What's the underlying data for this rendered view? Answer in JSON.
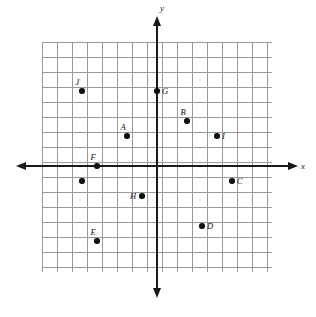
{
  "figure": {
    "type": "coordinate-plane",
    "title": "",
    "axis_labels": {
      "x": "x",
      "y": "y"
    },
    "grid": {
      "cell_px": 15,
      "origin_px": {
        "x": 157,
        "y": 166
      },
      "left_px": 42,
      "right_px": 272,
      "top_px": 42,
      "bottom_px": 272,
      "x_range": [
        -7,
        7
      ],
      "y_range": [
        -7,
        8
      ],
      "grid_color": "#9a9a9a",
      "axis_color": "#1a1a1a",
      "point_color": "#111111"
    }
  },
  "chart_data": {
    "type": "scatter",
    "title": "",
    "xlabel": "x",
    "ylabel": "y",
    "xlim": [
      -7,
      7
    ],
    "ylim": [
      -7,
      8
    ],
    "grid": true,
    "legend": "none",
    "points": [
      {
        "label": "J",
        "x": -5,
        "y": 5,
        "label_pos": "above-left"
      },
      {
        "label": "G",
        "x": 0,
        "y": 5,
        "label_pos": "right"
      },
      {
        "label": "B",
        "x": 2,
        "y": 3,
        "label_pos": "above-left"
      },
      {
        "label": "A",
        "x": -2,
        "y": 2,
        "label_pos": "above-left"
      },
      {
        "label": "I",
        "x": 4,
        "y": 2,
        "label_pos": "right"
      },
      {
        "label": "F",
        "x": -4,
        "y": 0,
        "label_pos": "above-left"
      },
      {
        "label": "",
        "x": -5,
        "y": -1,
        "label_pos": "none"
      },
      {
        "label": "C",
        "x": 5,
        "y": -1,
        "label_pos": "right"
      },
      {
        "label": "H",
        "x": -1,
        "y": -2,
        "label_pos": "left"
      },
      {
        "label": "D",
        "x": 3,
        "y": -4,
        "label_pos": "right"
      },
      {
        "label": "E",
        "x": -4,
        "y": -5,
        "label_pos": "above-left"
      }
    ]
  }
}
